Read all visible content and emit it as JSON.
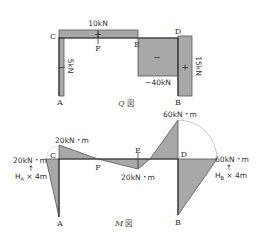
{
  "q_diagram": {
    "caption_symbol": "Q",
    "caption_suffix": "図",
    "nodes": {
      "A": "A",
      "B": "B",
      "C": "C",
      "D": "D",
      "E": "E",
      "F": "F"
    },
    "values": {
      "beam_CE": "10kN",
      "column_AC": "5kN",
      "column_AC_sign": "−",
      "span_ED": "−40kN",
      "span_ED_sign": "−",
      "column_DB": "15kN",
      "column_DB_sign": "+",
      "beam_sign": "+"
    }
  },
  "m_diagram": {
    "caption_symbol": "M",
    "caption_suffix": "図",
    "nodes": {
      "A": "A",
      "B": "B",
      "C": "C",
      "D": "D",
      "E": "E",
      "F": "F"
    },
    "values": {
      "C_beam": "20kN・m",
      "C_column": "20kN・m",
      "C_note": "H",
      "C_note_sub": "A",
      "C_note_rest": " × 4m",
      "E": "20kN・m",
      "D_beam": "60kN・m",
      "D_column": "60kN・m",
      "D_note": "H",
      "D_note_sub": "B",
      "D_note_rest": " × 4m"
    }
  }
}
